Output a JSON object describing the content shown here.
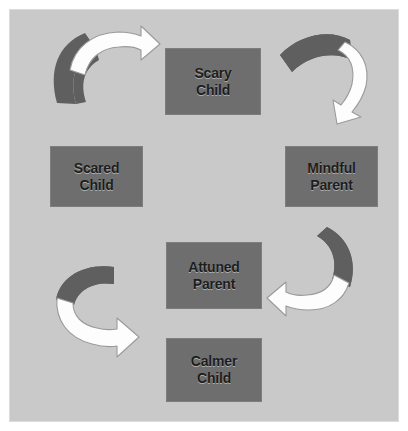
{
  "diagram": {
    "background_color": "#c9c9c9",
    "node_fill_color": "#6e6e6e",
    "node_text_color": "#1d1d1d",
    "arrow_body_color": "#fdfdfd",
    "arrow_shadow_color": "#5f5f5f",
    "nodes": [
      {
        "id": "scary-child",
        "line1": "Scary",
        "line2": "Child"
      },
      {
        "id": "scared-child",
        "line1": "Scared",
        "line2": "Child"
      },
      {
        "id": "mindful-parent",
        "line1": "Mindful",
        "line2": "Parent"
      },
      {
        "id": "attuned-parent",
        "line1": "Attuned",
        "line2": "Parent"
      },
      {
        "id": "calmer-child",
        "line1": "Calmer",
        "line2": "Child"
      }
    ],
    "arrows": [
      {
        "id": "scared-child-to-scary-child",
        "direction": "right",
        "position": "top-left"
      },
      {
        "id": "scary-child-to-mindful-parent",
        "direction": "down",
        "position": "top-right"
      },
      {
        "id": "mindful-parent-to-attuned-parent",
        "direction": "left",
        "position": "bottom-right"
      },
      {
        "id": "calmer-child-to-scared-child",
        "direction": "right",
        "position": "bottom-left"
      }
    ]
  }
}
